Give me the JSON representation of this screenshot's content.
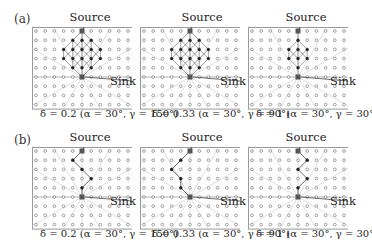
{
  "figure": {
    "rows": [
      {
        "label": "(a)",
        "panels": [
          {
            "title": "Source",
            "sink_label": "Sink",
            "caption": "δ = 0.2 (α = 30°, γ = 150°)",
            "path_style": "diamond-mesh",
            "width_cols": 3
          },
          {
            "title": "Source",
            "sink_label": "Sink",
            "caption": "δ = 0.33 (α = 30°, γ = 90°)",
            "path_style": "diamond-mesh",
            "width_cols": 2
          },
          {
            "title": "Source",
            "sink_label": "Sink",
            "caption": "δ = 1 (α = 30°, γ = 30°)",
            "path_style": "diamond-mesh",
            "width_cols": 1
          }
        ]
      },
      {
        "label": "(b)",
        "panels": [
          {
            "title": "Source",
            "sink_label": "Sink",
            "caption": "δ = 0.2 (α = 30°, γ = 150°)",
            "path_style": "single-path"
          },
          {
            "title": "Source",
            "sink_label": "Sink",
            "caption": "δ = 0.33 (α = 30°, γ = 90°)",
            "path_style": "single-path"
          },
          {
            "title": "Source",
            "sink_label": "Sink",
            "caption": "δ = 1 (α = 30°, γ = 30°)",
            "path_style": "single-path"
          }
        ]
      }
    ],
    "grid": {
      "cols": 11,
      "rows": 9
    },
    "colors": {
      "frame": "#9a9a9a",
      "node": "#8a8a8a",
      "active_node": "#222222",
      "rays": "#c8c8c8",
      "path": "#444444"
    }
  }
}
